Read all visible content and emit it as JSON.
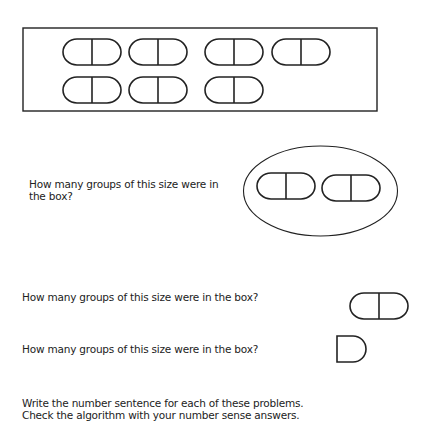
{
  "questions": {
    "q1": "How many groups of this size were in the box?",
    "q1_line1": "How many groups of this size were in",
    "q1_line2": "the box?",
    "q2": "How many groups of this size were in the box?",
    "q3": "How many groups of this size were in the box?"
  },
  "instructions": {
    "line1": "Write the number sentence for each of these problems.",
    "line2": "Check the algorithm with your number sense answers."
  },
  "figures": {
    "box_pill_count": 7,
    "group_pill_count": 2,
    "single_pill_count": 1,
    "half_pill_count": 1,
    "stroke_color": "#222222"
  }
}
